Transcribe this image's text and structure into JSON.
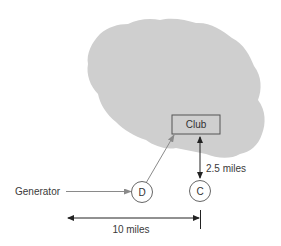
{
  "diagram": {
    "type": "schematic",
    "region": {
      "shape": "cloud",
      "fill": "#cfcfcf"
    },
    "club_box": {
      "label": "Club",
      "stroke": "#555555",
      "fill": "#cfcfcf"
    },
    "nodes": [
      {
        "id": "D",
        "label": "D",
        "role": "distribution-point"
      },
      {
        "id": "C",
        "label": "C",
        "role": "point"
      }
    ],
    "generator": {
      "label": "Generator"
    },
    "edges": [
      {
        "from": "Generator",
        "to": "D",
        "style": "arrow",
        "color": "#888888"
      },
      {
        "from": "D",
        "to": "Club",
        "style": "arrow",
        "color": "#888888"
      },
      {
        "from": "Club",
        "to": "C",
        "style": "double-arrow",
        "color": "#222222",
        "label": "2.5 miles"
      }
    ],
    "dimensions": [
      {
        "label": "2.5 miles",
        "between": [
          "Club",
          "C"
        ]
      },
      {
        "label": "10 miles",
        "between": [
          "left-reference",
          "C"
        ]
      }
    ],
    "labels": {
      "club": "Club",
      "node_d": "D",
      "node_c": "C",
      "generator": "Generator",
      "dist_vertical": "2.5 miles",
      "dist_horizontal": "10 miles"
    },
    "colors": {
      "cloud": "#cfcfcf",
      "gray_arrow": "#8a8a8a",
      "black_arrow": "#222222",
      "box_stroke": "#555555",
      "circle_stroke": "#666666",
      "text": "#333333"
    }
  }
}
